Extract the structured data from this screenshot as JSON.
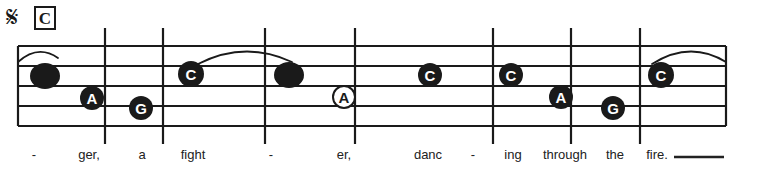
{
  "score": {
    "segno_symbol": "𝄋",
    "rehearsal_mark": "C",
    "staff": {
      "line_count": 5,
      "left": 18,
      "right": 726,
      "top": 46,
      "bottom": 126,
      "line_spacing": 20,
      "color": "#1a1a1a"
    },
    "barlines": [
      {
        "x": 105,
        "name": "barline-1"
      },
      {
        "x": 163,
        "name": "barline-2"
      },
      {
        "x": 265,
        "name": "barline-3"
      },
      {
        "x": 355,
        "name": "barline-4"
      },
      {
        "x": 493,
        "name": "barline-5"
      },
      {
        "x": 571,
        "name": "barline-6"
      },
      {
        "x": 640,
        "name": "barline-7"
      },
      {
        "x": 726,
        "name": "barline-end"
      }
    ],
    "notes": [
      {
        "index": 0,
        "label": "",
        "letter_shown": false,
        "filled": true,
        "cx": 45,
        "cy": 76,
        "rx": 15,
        "ry": 13
      },
      {
        "index": 1,
        "label": "A",
        "letter_shown": true,
        "filled": true,
        "cx": 92,
        "cy": 98,
        "rx": 12,
        "ry": 12
      },
      {
        "index": 2,
        "label": "G",
        "letter_shown": true,
        "filled": true,
        "cx": 141,
        "cy": 108,
        "rx": 12,
        "ry": 12
      },
      {
        "index": 3,
        "label": "C",
        "letter_shown": true,
        "filled": true,
        "cx": 191,
        "cy": 74,
        "rx": 13,
        "ry": 13
      },
      {
        "index": 4,
        "label": "",
        "letter_shown": false,
        "filled": true,
        "cx": 289,
        "cy": 75,
        "rx": 15,
        "ry": 13
      },
      {
        "index": 5,
        "label": "A",
        "letter_shown": true,
        "filled": false,
        "cx": 344,
        "cy": 97,
        "rx": 11,
        "ry": 11
      },
      {
        "index": 6,
        "label": "C",
        "letter_shown": true,
        "filled": true,
        "cx": 430,
        "cy": 75,
        "rx": 12,
        "ry": 12
      },
      {
        "index": 7,
        "label": "C",
        "letter_shown": true,
        "filled": true,
        "cx": 511,
        "cy": 75,
        "rx": 12,
        "ry": 12
      },
      {
        "index": 8,
        "label": "A",
        "letter_shown": true,
        "filled": true,
        "cx": 561,
        "cy": 97,
        "rx": 12,
        "ry": 12
      },
      {
        "index": 9,
        "label": "G",
        "letter_shown": true,
        "filled": true,
        "cx": 613,
        "cy": 108,
        "rx": 12,
        "ry": 12
      },
      {
        "index": 10,
        "label": "C",
        "letter_shown": true,
        "filled": true,
        "cx": 661,
        "cy": 75,
        "rx": 13,
        "ry": 13
      }
    ],
    "slurs": [
      {
        "name": "slur-pickup",
        "x1": 18,
        "y1": 62,
        "cx": 38,
        "cy": 44,
        "x2": 58,
        "y2": 58
      },
      {
        "name": "slur-1",
        "x1": 198,
        "y1": 64,
        "cx": 245,
        "cy": 40,
        "x2": 292,
        "y2": 62
      },
      {
        "name": "slur-2",
        "x1": 652,
        "y1": 64,
        "cx": 690,
        "cy": 40,
        "x2": 726,
        "y2": 62
      }
    ],
    "lyrics": [
      {
        "text": "-",
        "x": 34,
        "name": "lyric-syllable-1"
      },
      {
        "text": "ger,",
        "x": 89,
        "name": "lyric-syllable-2"
      },
      {
        "text": "a",
        "x": 142,
        "name": "lyric-syllable-3"
      },
      {
        "text": "fight",
        "x": 193,
        "name": "lyric-syllable-4"
      },
      {
        "text": "-",
        "x": 271,
        "name": "lyric-syllable-5"
      },
      {
        "text": "er,",
        "x": 344,
        "name": "lyric-syllable-6"
      },
      {
        "text": "danc",
        "x": 428,
        "name": "lyric-syllable-7"
      },
      {
        "text": "-",
        "x": 473,
        "name": "lyric-syllable-8"
      },
      {
        "text": "ing",
        "x": 513,
        "name": "lyric-syllable-9"
      },
      {
        "text": "through",
        "x": 565,
        "name": "lyric-syllable-10"
      },
      {
        "text": "the",
        "x": 615,
        "name": "lyric-syllable-11"
      },
      {
        "text": "fire.",
        "x": 657,
        "name": "lyric-syllable-12"
      }
    ],
    "lyric_extension": {
      "x1": 674,
      "x2": 724,
      "y": 157
    }
  }
}
